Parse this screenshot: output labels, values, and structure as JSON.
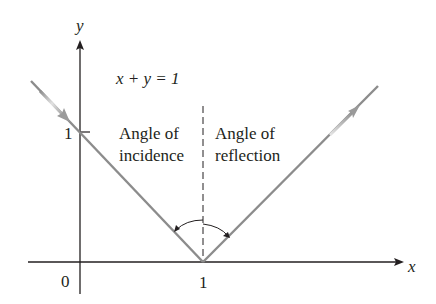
{
  "diagram": {
    "axes": {
      "x_label": "x",
      "y_label": "y",
      "origin_label": "0",
      "x_tick_label": "1",
      "y_tick_label": "1"
    },
    "equation": "x + y = 1",
    "labels": {
      "incidence_line1": "Angle of",
      "incidence_line2": "incidence",
      "reflection_line1": "Angle of",
      "reflection_line2": "reflection"
    },
    "colors": {
      "axis": "#231f20",
      "ray": "#8c8c8c",
      "text": "#231f20"
    }
  }
}
